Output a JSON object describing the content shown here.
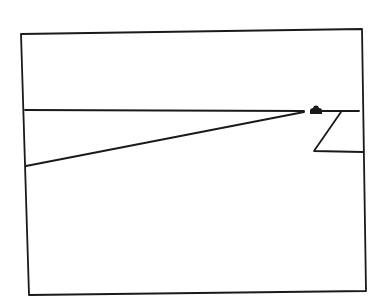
{
  "diagram": {
    "colors": {
      "ink": "#1a1a1a",
      "background": "#ffffff"
    },
    "frame": {
      "points": [
        [
          21,
          34
        ],
        [
          362,
          29
        ],
        [
          366,
          291
        ],
        [
          29,
          295
        ]
      ]
    },
    "horizon_left": {
      "from": [
        25,
        110
      ],
      "to": [
        304,
        111
      ]
    },
    "horizon_right": {
      "from": [
        318,
        111
      ],
      "to": [
        359,
        111
      ]
    },
    "road_edge": {
      "from": [
        26,
        166
      ],
      "to": [
        304,
        112
      ]
    },
    "zigzag": {
      "points": [
        [
          341,
          112
        ],
        [
          314,
          151
        ],
        [
          363,
          152
        ]
      ]
    },
    "object": {
      "label": "vehicle",
      "center": [
        316,
        111
      ],
      "width": 12,
      "height": 7
    }
  }
}
